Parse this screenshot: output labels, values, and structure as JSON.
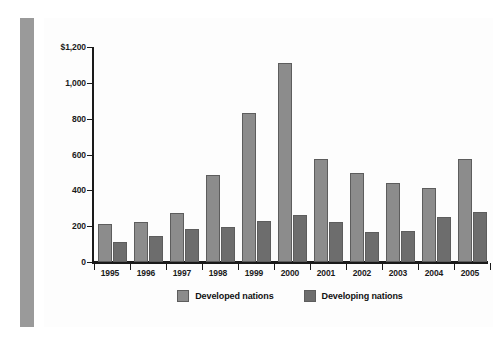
{
  "chart_data": {
    "type": "bar",
    "title": "",
    "subtitle": "",
    "xlabel": "",
    "ylabel": "",
    "categories": [
      "1995",
      "1996",
      "1997",
      "1998",
      "1999",
      "2000",
      "2001",
      "2002",
      "2003",
      "2004",
      "2005"
    ],
    "series": [
      {
        "name": "Developed nations",
        "color": "#8c8c8c",
        "values": [
          210,
          225,
          275,
          485,
          830,
          1110,
          575,
          495,
          440,
          415,
          575
        ]
      },
      {
        "name": "Developing nations",
        "color": "#6d6d6d",
        "values": [
          110,
          145,
          185,
          195,
          230,
          260,
          225,
          165,
          175,
          250,
          280
        ]
      }
    ],
    "ylim": [
      0,
      1200
    ],
    "ytick_values": [
      0,
      200,
      400,
      600,
      800,
      1000,
      1200
    ],
    "ytick_labels": [
      "0",
      "200",
      "400",
      "600",
      "800",
      "1,000",
      "$1,200"
    ],
    "grid": false,
    "legend_position": "bottom-center",
    "legend_entries": [
      "Developed nations",
      "Developing nations"
    ],
    "annotations": []
  },
  "figure": {
    "background_color": "#ffffff",
    "accent_strip_color": "#9a9a9a",
    "axis_color": "#1a1a1a"
  }
}
